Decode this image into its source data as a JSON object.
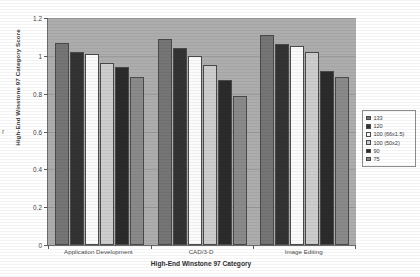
{
  "chart_data": {
    "type": "bar",
    "title": "",
    "xlabel": "High-End Winstone 97 Category",
    "ylabel": "High-End Winstone 97 Category Score",
    "ylim": [
      0,
      1.2
    ],
    "yticks": [
      "0",
      "0.2",
      "0.4",
      "0.6",
      "0.8",
      "1",
      "1.2"
    ],
    "ytick_values": [
      0,
      0.2,
      0.4,
      0.6,
      0.8,
      1.0,
      1.2
    ],
    "grid": true,
    "legend_position": "right",
    "categories": [
      "Application Development",
      "CAD/3-D",
      "Image Editing"
    ],
    "series": [
      {
        "name": "133",
        "color": "#757575",
        "values": [
          1.07,
          1.09,
          1.11
        ]
      },
      {
        "name": "120",
        "color": "#333333",
        "values": [
          1.02,
          1.04,
          1.06
        ]
      },
      {
        "name": "100 (66x1.5)",
        "color": "#fbfbfb",
        "values": [
          1.01,
          1.0,
          1.05
        ]
      },
      {
        "name": "100 (50x2)",
        "color": "#cdcdcd",
        "values": [
          0.96,
          0.95,
          1.02
        ]
      },
      {
        "name": "90",
        "color": "#2b2b2b",
        "values": [
          0.94,
          0.87,
          0.92
        ]
      },
      {
        "name": "75",
        "color": "#8a8a8a",
        "values": [
          0.89,
          0.79,
          0.89
        ]
      }
    ]
  },
  "legend": {
    "items": [
      {
        "label": "133"
      },
      {
        "label": "120"
      },
      {
        "label": "100 (66x1.5)"
      },
      {
        "label": "100 (50x2)"
      },
      {
        "label": "90"
      },
      {
        "label": "75"
      }
    ]
  },
  "stray_mark": "r"
}
